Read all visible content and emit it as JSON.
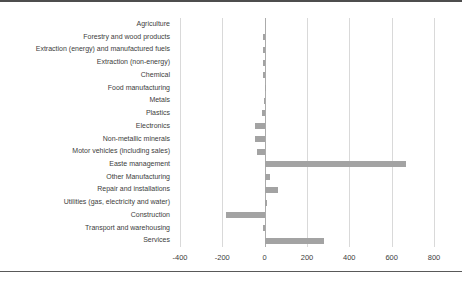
{
  "page": {
    "background": "#ffffff",
    "top_rule_color": "#4d4d4d",
    "bottom_rule_color": "#595959"
  },
  "chart_data": {
    "type": "bar",
    "orientation": "horizontal",
    "title": "",
    "xlabel": "",
    "ylabel": "",
    "legend": "none",
    "grid": "vertical",
    "categories": [
      "Agriculture",
      "Forestry and wood products",
      "Extraction (energy) and manufactured fuels",
      "Extraction (non-energy)",
      "Chemical",
      "Food manufacturing",
      "Metals",
      "Plastics",
      "Electronics",
      "Non-metallic minerals",
      "Motor vehicles (including sales)",
      "Easte management",
      "Other Manufacturing",
      "Repair and installations",
      "Utilities (gas, electricity and water)",
      "Construction",
      "Transport and warehousing",
      "Services"
    ],
    "values": [
      0,
      -10,
      -10,
      -8,
      -8,
      5,
      -2,
      -15,
      -48,
      -48,
      -36,
      670,
      25,
      62,
      10,
      -185,
      -6,
      282
    ],
    "axis": {
      "min": -400,
      "max": 800,
      "ticks": [
        -400,
        -200,
        0,
        200,
        400,
        600,
        800
      ],
      "tick_labels": [
        "-400",
        "-200",
        "0",
        "200",
        "400",
        "600",
        "800"
      ]
    },
    "colors": {
      "bar": "#a3a3a3",
      "gridline": "#d9d9d9",
      "zero_line": "#ababab",
      "text": "#3d3d3d"
    }
  }
}
